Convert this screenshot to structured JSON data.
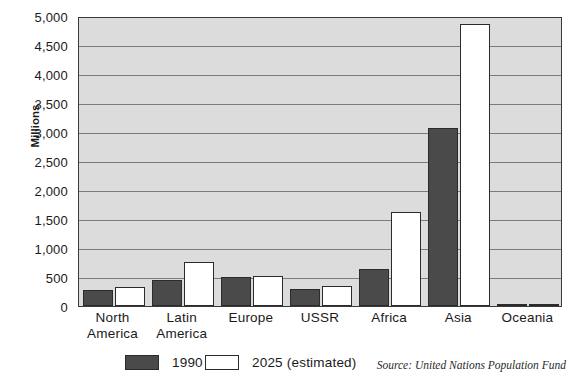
{
  "chart_data": {
    "type": "bar",
    "title": "",
    "xlabel": "",
    "ylabel": "Millions",
    "ylim": [
      0,
      5000
    ],
    "grid": true,
    "legend_position": "bottom",
    "categories": [
      "North America",
      "Latin America",
      "Europe",
      "USSR",
      "Africa",
      "Asia",
      "Oceania"
    ],
    "category_lines": [
      [
        "North",
        "America"
      ],
      [
        "Latin",
        "America"
      ],
      [
        "Europe",
        ""
      ],
      [
        "USSR",
        ""
      ],
      [
        "Africa",
        ""
      ],
      [
        "Asia",
        ""
      ],
      [
        "Oceania",
        ""
      ]
    ],
    "series": [
      {
        "name": "1990",
        "color": "#4a4a4a",
        "values": [
          280,
          450,
          500,
          290,
          640,
          3070,
          25
        ]
      },
      {
        "name": "2025 (estimated)",
        "color": "#ffffff",
        "values": [
          330,
          760,
          515,
          350,
          1620,
          4870,
          40
        ]
      }
    ],
    "y_ticks": [
      "0",
      "500",
      "1,000",
      "1,500",
      "2,000",
      "2,500",
      "3,000",
      "3,500",
      "4,000",
      "4,500",
      "5,000"
    ],
    "y_tick_values": [
      0,
      500,
      1000,
      1500,
      2000,
      2500,
      3000,
      3500,
      4000,
      4500,
      5000
    ],
    "source_note": "Source: United Nations Population Fund"
  },
  "legend": {
    "items": [
      {
        "label": "1990",
        "style": "filled"
      },
      {
        "label": "2025 (estimated)",
        "style": "hollow"
      }
    ]
  },
  "colors": {
    "plot_background": "#dcdcdc",
    "gridline": "#7c7c7c",
    "axis": "#3a3a3a",
    "series_1990": "#4a4a4a",
    "series_2025": "#ffffff"
  }
}
